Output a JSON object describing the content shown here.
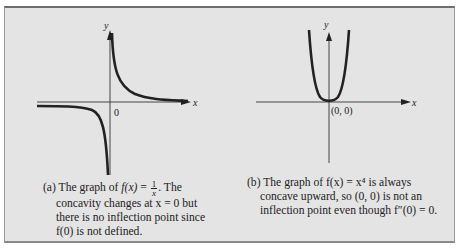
{
  "figure": {
    "panel_a": {
      "axis_x_label": "x",
      "axis_y_label": "y",
      "origin_label": "0",
      "caption_prefix": "(a) The graph of ",
      "caption_func": "f(x)",
      "caption_eq": " = ",
      "caption_num": "1",
      "caption_den": "x",
      "caption_after": ". The",
      "caption_line2": "concavity changes at x = 0 but",
      "caption_line3": "there is no inflection point since",
      "caption_line4": "f(0) is not defined."
    },
    "panel_b": {
      "axis_x_label": "x",
      "axis_y_label": "y",
      "origin_label": "(0, 0)",
      "caption_line1": "(b) The graph of f(x) = x⁴ is always",
      "caption_line2": "concave upward, so (0, 0) is not an",
      "caption_line3": "inflection point even though f″(0) = 0."
    }
  },
  "colors": {
    "background": "#e4e4e4",
    "curve": "#222222",
    "axis": "#333333"
  }
}
